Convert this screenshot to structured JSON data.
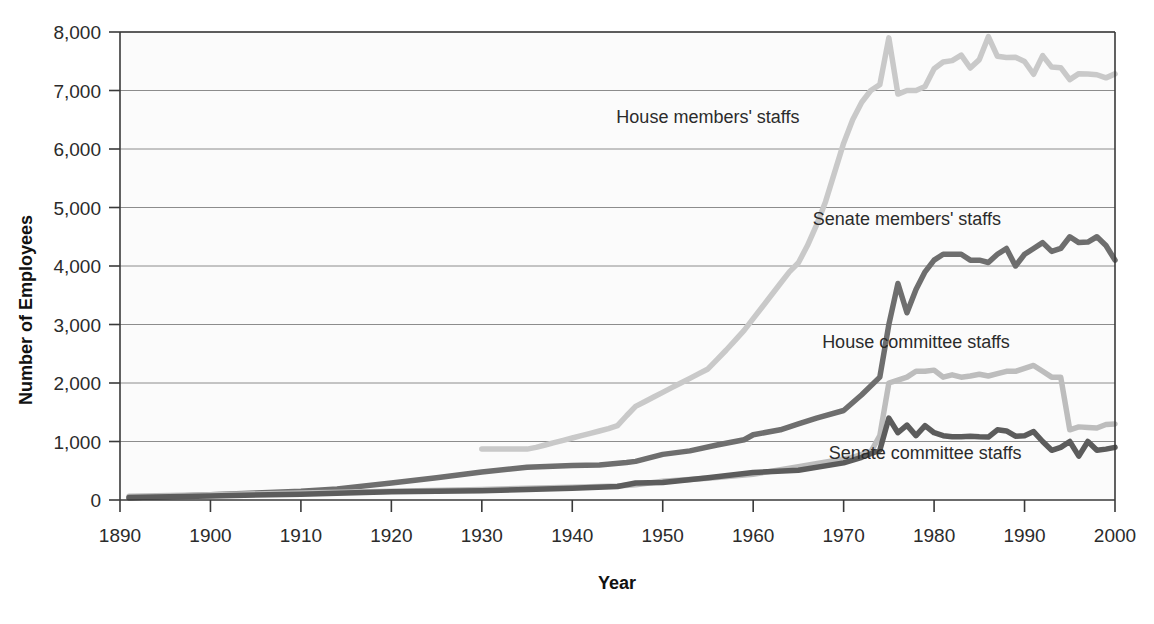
{
  "chart_data": {
    "type": "line",
    "title": "",
    "xlabel": "Year",
    "ylabel": "Number of Employees",
    "xlim": [
      1890,
      2000
    ],
    "ylim": [
      0,
      8000
    ],
    "grid": true,
    "legend_position": "inline-annotations",
    "x_ticks": [
      1890,
      1900,
      1910,
      1920,
      1930,
      1940,
      1950,
      1960,
      1970,
      1980,
      1990,
      2000
    ],
    "x_tick_labels": [
      "1890",
      "1900",
      "1910",
      "1920",
      "1930",
      "1940",
      "1950",
      "1960",
      "1970",
      "1980",
      "1990",
      "2000"
    ],
    "y_ticks": [
      0,
      1000,
      2000,
      3000,
      4000,
      5000,
      6000,
      7000,
      8000
    ],
    "y_tick_labels": [
      "0",
      "1,000",
      "2,000",
      "3,000",
      "4,000",
      "5,000",
      "6,000",
      "7,000",
      "8,000"
    ],
    "series": [
      {
        "name": "House members' staffs",
        "color": "#c9c9c9",
        "label_x": 1955,
        "label_y": 6450,
        "x": [
          1930,
          1931,
          1932,
          1933,
          1934,
          1935,
          1936,
          1937,
          1938,
          1939,
          1940,
          1941,
          1942,
          1943,
          1944,
          1945,
          1946,
          1947,
          1948,
          1949,
          1950,
          1951,
          1952,
          1953,
          1954,
          1955,
          1956,
          1957,
          1958,
          1959,
          1960,
          1961,
          1962,
          1963,
          1964,
          1965,
          1966,
          1967,
          1968,
          1969,
          1970,
          1971,
          1972,
          1973,
          1974,
          1975,
          1976,
          1977,
          1978,
          1979,
          1980,
          1981,
          1982,
          1983,
          1984,
          1985,
          1986,
          1987,
          1988,
          1989,
          1990,
          1991,
          1992,
          1993,
          1994,
          1995,
          1996,
          1997,
          1998,
          1999,
          2000
        ],
        "y": [
          870,
          870,
          870,
          870,
          870,
          870,
          900,
          940,
          980,
          1020,
          1060,
          1100,
          1140,
          1180,
          1220,
          1270,
          1440,
          1600,
          1680,
          1760,
          1840,
          1920,
          2000,
          2080,
          2160,
          2240,
          2400,
          2560,
          2730,
          2900,
          3100,
          3300,
          3500,
          3700,
          3900,
          4055,
          4350,
          4700,
          5100,
          5600,
          6100,
          6500,
          6800,
          7000,
          7100,
          7900,
          6939,
          7000,
          7000,
          7067,
          7371,
          7487,
          7511,
          7606,
          7385,
          7528,
          7920,
          7584,
          7564,
          7569,
          7496,
          7278,
          7597,
          7400,
          7390,
          7186,
          7288,
          7282,
          7269,
          7216,
          7284
        ]
      },
      {
        "name": "Senate members' staffs",
        "color": "#6e6e6e",
        "label_x": 1977,
        "label_y": 4700,
        "x": [
          1891,
          1895,
          1900,
          1905,
          1910,
          1914,
          1920,
          1925,
          1930,
          1935,
          1940,
          1943,
          1946,
          1947,
          1950,
          1953,
          1956,
          1959,
          1960,
          1963,
          1965,
          1967,
          1970,
          1972,
          1974,
          1975,
          1976,
          1977,
          1978,
          1979,
          1980,
          1981,
          1982,
          1983,
          1984,
          1985,
          1986,
          1987,
          1988,
          1989,
          1990,
          1991,
          1992,
          1993,
          1994,
          1995,
          1996,
          1997,
          1998,
          1999,
          2000
        ],
        "y": [
          39,
          60,
          90,
          120,
          150,
          190,
          290,
          380,
          480,
          560,
          590,
          600,
          640,
          660,
          780,
          840,
          940,
          1030,
          1115,
          1200,
          1300,
          1400,
          1530,
          1800,
          2100,
          3000,
          3700,
          3200,
          3600,
          3900,
          4100,
          4200,
          4200,
          4200,
          4100,
          4100,
          4060,
          4200,
          4300,
          4000,
          4200,
          4300,
          4400,
          4250,
          4300,
          4500,
          4400,
          4410,
          4500,
          4350,
          4100
        ]
      },
      {
        "name": "House committee staffs",
        "color": "#bdbdbd",
        "label_x": 1978,
        "label_y": 2600,
        "x": [
          1891,
          1900,
          1910,
          1920,
          1930,
          1935,
          1940,
          1945,
          1947,
          1950,
          1955,
          1960,
          1965,
          1970,
          1971,
          1972,
          1973,
          1974,
          1975,
          1976,
          1977,
          1978,
          1979,
          1980,
          1981,
          1982,
          1983,
          1984,
          1985,
          1986,
          1987,
          1988,
          1989,
          1990,
          1991,
          1992,
          1993,
          1994,
          1995,
          1996,
          1997,
          1998,
          1999,
          2000
        ],
        "y": [
          62,
          90,
          120,
          150,
          180,
          200,
          220,
          240,
          260,
          320,
          370,
          440,
          570,
          700,
          730,
          780,
          820,
          1100,
          2000,
          2050,
          2100,
          2200,
          2200,
          2220,
          2100,
          2140,
          2100,
          2120,
          2150,
          2120,
          2160,
          2200,
          2200,
          2250,
          2300,
          2200,
          2100,
          2100,
          1200,
          1250,
          1240,
          1230,
          1290,
          1300
        ]
      },
      {
        "name": "Senate committee staffs",
        "color": "#5c5c5c",
        "label_x": 1979,
        "label_y": 700,
        "x": [
          1891,
          1900,
          1910,
          1920,
          1930,
          1935,
          1940,
          1945,
          1947,
          1950,
          1955,
          1960,
          1965,
          1970,
          1971,
          1972,
          1973,
          1974,
          1975,
          1976,
          1977,
          1978,
          1979,
          1980,
          1981,
          1982,
          1983,
          1984,
          1985,
          1986,
          1987,
          1988,
          1989,
          1990,
          1991,
          1992,
          1993,
          1994,
          1995,
          1996,
          1997,
          1998,
          1999,
          2000
        ],
        "y": [
          41,
          70,
          100,
          140,
          160,
          180,
          200,
          230,
          290,
          300,
          380,
          470,
          509,
          635,
          680,
          730,
          790,
          850,
          1400,
          1150,
          1280,
          1100,
          1270,
          1150,
          1100,
          1080,
          1080,
          1090,
          1080,
          1075,
          1200,
          1180,
          1090,
          1100,
          1170,
          1000,
          850,
          900,
          1000,
          750,
          1000,
          850,
          870,
          900
        ]
      }
    ]
  },
  "axes": {
    "y_axis_title": "Number of Employees",
    "x_axis_title": "Year"
  }
}
